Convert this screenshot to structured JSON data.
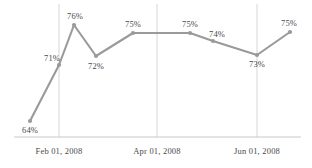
{
  "chart_data": {
    "type": "line",
    "title": "",
    "subtitle": "",
    "xlabel": "",
    "ylabel": "",
    "grid": "vertical-only",
    "legend": "none",
    "ylim": [
      60,
      78
    ],
    "series": [
      {
        "name": "",
        "color": "#9a9a9a",
        "values": [
          64,
          71,
          76,
          72,
          75,
          75,
          74,
          73,
          75
        ],
        "data_labels": [
          "64%",
          "71%",
          "76%",
          "72%",
          "75%",
          "75%",
          "74%",
          "73%",
          "75%"
        ],
        "points": [
          {
            "label": "64%",
            "value": 64,
            "px": 30,
            "py": 121,
            "label_x": 30,
            "label_y": 126,
            "label_pos": "below"
          },
          {
            "label": "71%",
            "value": 71,
            "px": 59,
            "py": 65,
            "label_x": 52,
            "label_y": 54,
            "label_pos": "above-left"
          },
          {
            "label": "76%",
            "value": 76,
            "px": 74,
            "py": 25,
            "label_x": 75,
            "label_y": 12,
            "label_pos": "above"
          },
          {
            "label": "72%",
            "value": 72,
            "px": 96,
            "py": 56,
            "label_x": 96,
            "label_y": 62,
            "label_pos": "below"
          },
          {
            "label": "75%",
            "value": 75,
            "px": 133,
            "py": 33,
            "label_x": 133,
            "label_y": 20,
            "label_pos": "above"
          },
          {
            "label": "75%",
            "value": 75,
            "px": 190,
            "py": 33,
            "label_x": 190,
            "label_y": 20,
            "label_pos": "above"
          },
          {
            "label": "74%",
            "value": 74,
            "px": 213,
            "py": 41,
            "label_x": 217,
            "label_y": 30,
            "label_pos": "above"
          },
          {
            "label": "73%",
            "value": 73,
            "px": 257,
            "py": 55,
            "label_x": 257,
            "label_y": 60,
            "label_pos": "below"
          },
          {
            "label": "75%",
            "value": 75,
            "px": 290,
            "py": 32,
            "label_x": 289,
            "label_y": 19,
            "label_pos": "above"
          }
        ]
      }
    ],
    "x_ticks": [
      {
        "label": "Feb 01, 2008",
        "px": 59,
        "label_x": 59,
        "gridline": true
      },
      {
        "label": "Apr 01, 2008",
        "px": 157,
        "label_x": 157,
        "gridline": true
      },
      {
        "label": "Jun 01, 2008",
        "px": 257,
        "label_x": 257,
        "gridline": true
      }
    ],
    "axis": {
      "baseline_y": 137,
      "baseline_x_start": 14,
      "baseline_x_end": 301,
      "tick_label_y": 147
    },
    "colors": {
      "line": "#9a9a9a",
      "marker": "#9a9a9a",
      "gridline": "#d6d6d6",
      "baseline": "#c9c9c9",
      "text": "#4a4a4a",
      "background": "#ffffff"
    }
  }
}
